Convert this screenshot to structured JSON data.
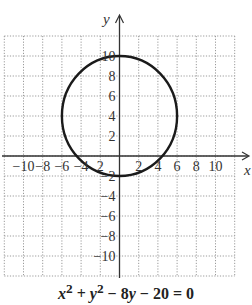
{
  "chart_data": {
    "type": "line",
    "title": "",
    "equation": "x² + y² − 8y − 20 = 0",
    "equation_parts": [
      "x",
      "2",
      " + ",
      "y",
      "2",
      " − 8",
      "y",
      " − 20 = 0"
    ],
    "xlabel": "x",
    "ylabel": "y",
    "xlim": [
      -12,
      12
    ],
    "ylim": [
      -12,
      12
    ],
    "grid": true,
    "grid_step": 2,
    "x_ticks": [
      -10,
      -8,
      -6,
      -4,
      -2,
      2,
      4,
      6,
      8,
      10
    ],
    "x_tick_labels": [
      "−10",
      "−8",
      "−6",
      "−4",
      "2",
      "2",
      "4",
      "6",
      "8",
      "10"
    ],
    "y_ticks": [
      10,
      8,
      6,
      4,
      2,
      -2,
      -4,
      -6,
      -8,
      -10
    ],
    "y_tick_labels": [
      "10",
      "8",
      "6",
      "4",
      "2",
      "−2",
      "−4",
      "−6",
      "−8",
      "−10"
    ],
    "series": [
      {
        "name": "circle",
        "shape": "circle",
        "center": [
          0,
          4
        ],
        "radius": 6,
        "color": "#1a1a1a"
      }
    ],
    "legend": null
  },
  "colors": {
    "grid": "#9a9a9a",
    "axis": "#333333",
    "curve": "#1a1a1a"
  }
}
